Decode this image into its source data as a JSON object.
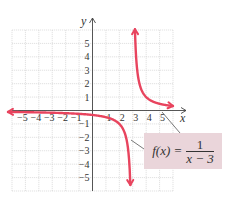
{
  "chart_data": {
    "type": "line",
    "title": "",
    "function": "f(x) = 1/(x - 3)",
    "xlabel": "x",
    "ylabel": "y",
    "xlim": [
      -6,
      6
    ],
    "ylim": [
      -6,
      6
    ],
    "grid": true,
    "x_ticks": [
      -5,
      -4,
      -3,
      -2,
      -1,
      1,
      2,
      3,
      4,
      5
    ],
    "y_ticks": [
      5,
      4,
      3,
      2,
      1,
      -1,
      -2,
      -3,
      -4,
      -5
    ],
    "vertical_asymptote": 3,
    "horizontal_asymptote": 0,
    "series": [
      {
        "name": "left branch",
        "x": [
          -6,
          -5,
          -4,
          -3,
          -2,
          -1,
          0,
          1,
          2,
          2.5,
          2.8
        ],
        "y": [
          -0.111,
          -0.125,
          -0.143,
          -0.167,
          -0.2,
          -0.25,
          -0.333,
          -0.5,
          -1,
          -2,
          -5
        ]
      },
      {
        "name": "right branch",
        "x": [
          3.17,
          3.25,
          3.5,
          4,
          5,
          6
        ],
        "y": [
          6,
          4,
          2,
          1,
          0.5,
          0.333
        ]
      }
    ],
    "curve_color": "#e8445e",
    "annotation": {
      "lhs": "f(x) =",
      "numerator": "1",
      "denominator": "x − 3"
    }
  },
  "labels": {
    "x_axis": "x",
    "y_axis": "y",
    "x_tick_labels": [
      "−5",
      "−4",
      "−3",
      "−2",
      "−1",
      "1",
      "2",
      "3",
      "4",
      "5"
    ],
    "y_tick_labels": [
      "5",
      "4",
      "3",
      "2",
      "1",
      "−1",
      "−2",
      "−3",
      "−4",
      "−5"
    ]
  }
}
